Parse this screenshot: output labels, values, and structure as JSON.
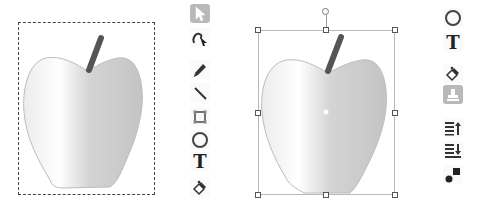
{
  "left_editor": {
    "state": "apple bitmap with dashed marquee selection",
    "toolbar": {
      "selected_tool": "select",
      "tools": [
        {
          "id": "select",
          "icon": "arrow-cursor-icon",
          "selected": true
        },
        {
          "id": "reshape",
          "icon": "reshape-icon",
          "selected": false
        },
        {
          "id": "pencil",
          "icon": "pencil-icon",
          "selected": false
        },
        {
          "id": "line",
          "icon": "line-icon",
          "selected": false
        },
        {
          "id": "rectangle",
          "icon": "rectangle-icon",
          "selected": false
        },
        {
          "id": "ellipse",
          "icon": "ellipse-icon",
          "selected": false
        },
        {
          "id": "text",
          "icon": "text-icon",
          "label": "T",
          "selected": false
        },
        {
          "id": "fill",
          "icon": "paint-bucket-icon",
          "selected": false
        }
      ]
    }
  },
  "right_editor": {
    "state": "apple with transform selection handles",
    "toolbar": {
      "selected_tool": "stamp",
      "tools": [
        {
          "id": "ellipse",
          "icon": "ellipse-icon",
          "selected": false
        },
        {
          "id": "text",
          "icon": "text-icon",
          "label": "T",
          "selected": false
        },
        {
          "id": "fill",
          "icon": "paint-bucket-icon",
          "selected": false
        },
        {
          "id": "stamp",
          "icon": "stamp-icon",
          "selected": true
        },
        {
          "id": "forward",
          "icon": "bring-forward-icon",
          "selected": false
        },
        {
          "id": "backward",
          "icon": "send-backward-icon",
          "selected": false
        },
        {
          "id": "group",
          "icon": "group-shapes-icon",
          "selected": false
        }
      ]
    }
  },
  "colors": {
    "selected_tool_bg": "#b9b9b9",
    "stem": "#555555",
    "apple_light": "#ffffff",
    "apple_dark": "#c8c8c8",
    "apple_outline": "#bdbdbd",
    "handle_border": "#555555",
    "selection_line": "#b8b8b8"
  }
}
